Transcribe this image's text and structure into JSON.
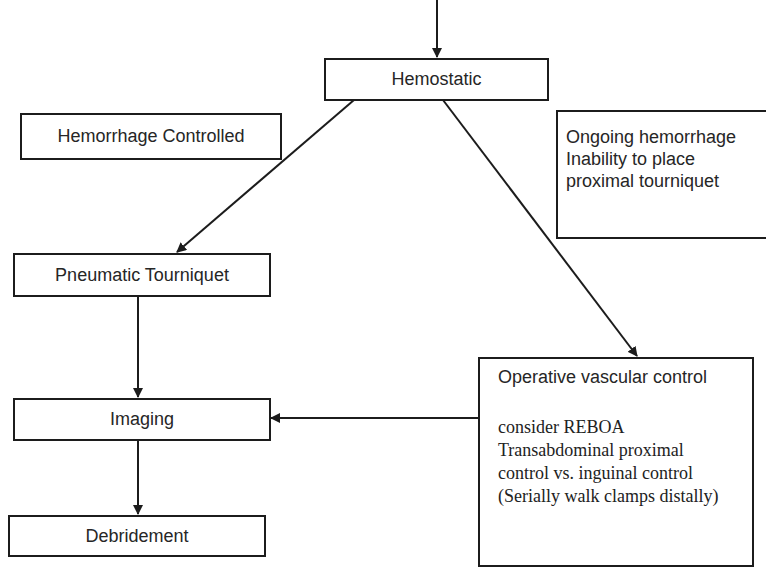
{
  "diagram": {
    "type": "flowchart",
    "nodes": {
      "hemostatic": {
        "label": "Hemostatic"
      },
      "hemorrhage_controlled": {
        "label": "Hemorrhage Controlled"
      },
      "ongoing": {
        "lines": [
          "Ongoing hemorrhage",
          "Inability to place",
          "proximal tourniquet"
        ]
      },
      "pneumatic_tourniquet": {
        "label": "Pneumatic Tourniquet"
      },
      "imaging": {
        "label": "Imaging"
      },
      "debridement": {
        "label": "Debridement"
      },
      "operative_vascular_control": {
        "title": "Operative vascular control",
        "lines": [
          "consider REBOA",
          "Transabdominal proximal",
          "control vs. inguinal control",
          "(Serially walk clamps distally)"
        ]
      }
    },
    "edges": [
      {
        "from": "(above)",
        "to": "Hemostatic"
      },
      {
        "from": "Hemostatic",
        "to": "Pneumatic Tourniquet",
        "condition": "Hemorrhage Controlled"
      },
      {
        "from": "Hemostatic",
        "to": "Operative vascular control",
        "condition": "Ongoing hemorrhage / Inability to place proximal tourniquet"
      },
      {
        "from": "Pneumatic Tourniquet",
        "to": "Imaging"
      },
      {
        "from": "Operative vascular control",
        "to": "Imaging"
      },
      {
        "from": "Imaging",
        "to": "Debridement"
      }
    ],
    "colors": {
      "line": "#1c1c1c",
      "text": "#262626",
      "background": "#ffffff"
    }
  }
}
